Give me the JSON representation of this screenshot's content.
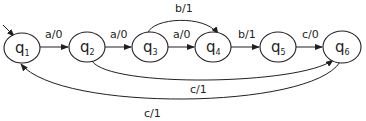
{
  "diagram": {
    "type": "finite-state-machine",
    "start_state": "q1",
    "states": [
      {
        "id": "q1",
        "label": "q",
        "sub": "1"
      },
      {
        "id": "q2",
        "label": "q",
        "sub": "2"
      },
      {
        "id": "q3",
        "label": "q",
        "sub": "3"
      },
      {
        "id": "q4",
        "label": "q",
        "sub": "4"
      },
      {
        "id": "q5",
        "label": "q",
        "sub": "5"
      },
      {
        "id": "q6",
        "label": "q",
        "sub": "6"
      }
    ],
    "transitions": [
      {
        "from": "q1",
        "to": "q2",
        "label": "a/0"
      },
      {
        "from": "q2",
        "to": "q3",
        "label": "a/0"
      },
      {
        "from": "q3",
        "to": "q4",
        "label": "a/0"
      },
      {
        "from": "q3",
        "to": "q4",
        "label": "b/1"
      },
      {
        "from": "q4",
        "to": "q5",
        "label": "b/1"
      },
      {
        "from": "q5",
        "to": "q6",
        "label": "c/0"
      },
      {
        "from": "q2",
        "to": "q6",
        "label": "c/1"
      },
      {
        "from": "q6",
        "to": "q1",
        "label": "c/1"
      }
    ]
  }
}
